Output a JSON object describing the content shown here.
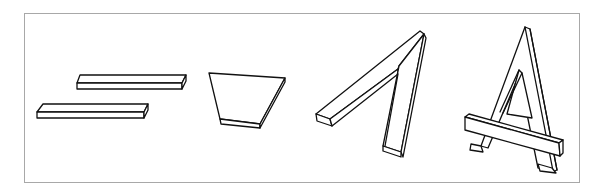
{
  "diagram": {
    "frame_color": "#a8a8a8",
    "line_color": "#111111",
    "background": "#ffffff",
    "steps": [
      {
        "id": 1,
        "label": "",
        "shape": "two-planks"
      },
      {
        "id": 2,
        "label": "",
        "shape": "trapezoid-board"
      },
      {
        "id": 3,
        "label": "",
        "shape": "seven-frame"
      },
      {
        "id": 4,
        "label": "",
        "shape": "a-frame-with-crossbar"
      }
    ]
  }
}
